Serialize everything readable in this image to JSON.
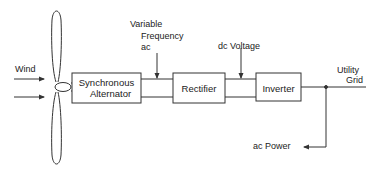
{
  "diagram": {
    "type": "block-diagram",
    "title": "",
    "inputs": {
      "wind_label": "Wind"
    },
    "blocks": [
      {
        "id": "alternator",
        "label_line1": "Synchronous",
        "label_line2": "Alternator"
      },
      {
        "id": "rectifier",
        "label": "Rectifier"
      },
      {
        "id": "inverter",
        "label": "Inverter"
      }
    ],
    "signals": {
      "variable_ac_line1": "Variable",
      "variable_ac_line2": "Frequency",
      "variable_ac_line3": "ac",
      "dc_voltage": "dc Voltage",
      "utility_line1": "Utility",
      "utility_line2": "Grid",
      "ac_power": "ac Power"
    },
    "colors": {
      "line": "#333333",
      "text": "#222222",
      "background": "#ffffff"
    }
  }
}
